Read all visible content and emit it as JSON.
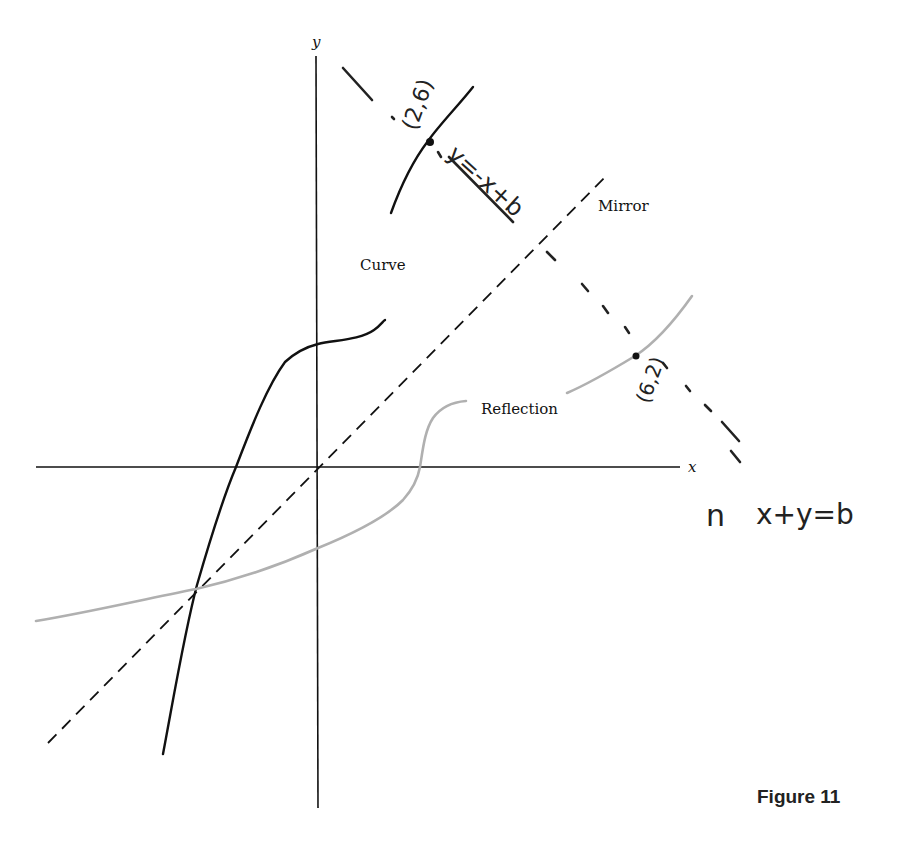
{
  "figure": {
    "caption": "Figure 11",
    "axes": {
      "x_label": "x",
      "y_label": "y"
    },
    "labels": {
      "curve": "Curve",
      "reflection": "Reflection",
      "mirror": "Mirror"
    },
    "annotations": {
      "point_on_curve": "(2,6)",
      "point_on_reflection": "(6,2)",
      "perpendicular_line_eq": "y=-x+b",
      "side_equation": "x+y=b",
      "side_mark": "n"
    },
    "colors": {
      "curve": "#111111",
      "reflection": "#b0b0b0",
      "mirror": "#111111",
      "axes": "#111111",
      "ink": "#1a1a1a"
    }
  }
}
